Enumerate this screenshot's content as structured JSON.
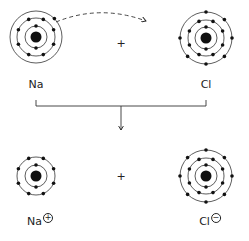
{
  "diagram": {
    "top_row": {
      "left_atom": {
        "symbol": "Na",
        "shells": [
          2,
          8,
          1
        ]
      },
      "operator": "+",
      "right_atom": {
        "symbol": "Cl",
        "shells": [
          2,
          8,
          7
        ]
      },
      "transfer_arrow": "dashed electron transfer arrow from Na outer electron toward Cl"
    },
    "reaction_arrow": "down-arrow",
    "bottom_row": {
      "left_ion": {
        "symbol": "Na",
        "charge": "+",
        "shells": [
          2,
          8
        ]
      },
      "operator": "+",
      "right_ion": {
        "symbol": "Cl",
        "charge": "−",
        "shells": [
          2,
          8,
          8
        ]
      }
    },
    "colors": {
      "ink": "#222222",
      "background": "#ffffff"
    }
  }
}
